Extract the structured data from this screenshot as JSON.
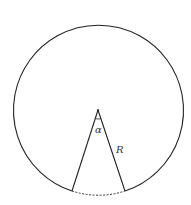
{
  "diagram": {
    "title": "",
    "labels": {
      "angle": "α",
      "radius": "R"
    },
    "geometry": {
      "center": [
        98,
        110
      ],
      "radius": 85,
      "chord_left": [
        72,
        191
      ],
      "chord_right": [
        125,
        191
      ],
      "dashed_arc": "between chord endpoints (removed sector)"
    },
    "colors": {
      "stroke": "#222222",
      "background": "#ffffff"
    }
  }
}
